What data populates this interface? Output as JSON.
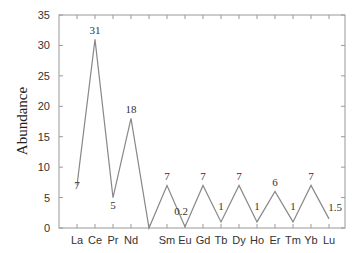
{
  "chart_data": {
    "type": "line",
    "title": "",
    "xlabel": "",
    "ylabel": "Abundance",
    "ylim": [
      0,
      35
    ],
    "yticks": [
      0,
      5,
      10,
      15,
      20,
      25,
      30,
      35
    ],
    "grid": false,
    "legend": null,
    "categories": [
      "La",
      "Ce",
      "Pr",
      "Nd",
      "Pm",
      "Sm",
      "Eu",
      "Gd",
      "Tb",
      "Dy",
      "Ho",
      "Er",
      "Tm",
      "Yb",
      "Lu"
    ],
    "x_tick_labels": [
      "La",
      "Ce",
      "Pr",
      "Nd",
      "",
      "Sm",
      "Eu",
      "Gd",
      "Tb",
      "Dy",
      "Ho",
      "Er",
      "Tm",
      "Yb",
      "Lu"
    ],
    "series": [
      {
        "name": "Abundance",
        "values": [
          7,
          31,
          5,
          18,
          0,
          7,
          0.2,
          7,
          1,
          7,
          1,
          6,
          1,
          7,
          1.5
        ],
        "data_labels": [
          "7",
          "31",
          "5",
          "18",
          "",
          "7",
          "0.2",
          "7",
          "1",
          "7",
          "1",
          "6",
          "1",
          "7",
          "1.5"
        ],
        "color": "#888888"
      }
    ]
  },
  "colors": {
    "line": "#888888",
    "axis": "#999999",
    "text": "#333333"
  }
}
